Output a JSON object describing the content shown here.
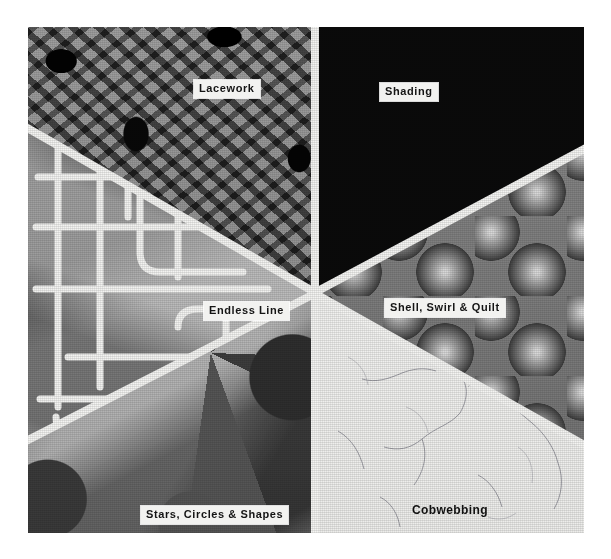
{
  "plate": {
    "kind": "photographic-plate",
    "description": "Six quilting / machine-stitching technique samples arranged as wedges around a common center, separated by white dividing bands.",
    "background_color": "#ffffff",
    "divider_color": "#f4f4f2",
    "label_box_color": "#f2f2f0",
    "label_text_color": "#141414",
    "panels": [
      {
        "id": "lacework",
        "label": "Lacework",
        "position": "top-left",
        "label_style": "boxed",
        "texture": "dense dark floral lace net on mid-grey ground"
      },
      {
        "id": "endless-line",
        "label": "Endless Line",
        "position": "middle-left",
        "label_style": "boxed",
        "texture": "continuous meandering white stitch line over geometric grey facets"
      },
      {
        "id": "stars-circles-shapes",
        "label": "Stars, Circles & Shapes",
        "position": "bottom-left",
        "label_style": "boxed",
        "texture": "overlapping circles, triangles and star facets in grey tones"
      },
      {
        "id": "shading",
        "label": "Shading",
        "position": "top-right",
        "label_style": "boxed",
        "texture": "radiating dark-to-light gradient rays fanning from lower right"
      },
      {
        "id": "shell-swirl-quilt",
        "label": "Shell, Swirl & Quilt",
        "position": "middle-right",
        "label_style": "boxed",
        "texture": "rows of overlapping shaded clamshell / scallop domes"
      },
      {
        "id": "cobwebbing",
        "label": "Cobwebbing",
        "position": "bottom-right",
        "label_style": "plain",
        "texture": "fine scattered thread filaments on near-white ground"
      }
    ]
  }
}
